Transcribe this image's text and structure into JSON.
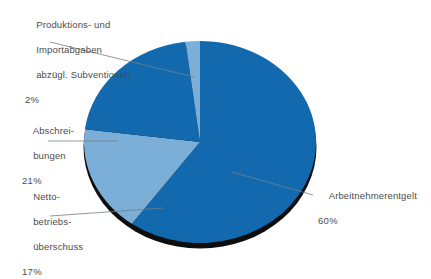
{
  "chart_data": {
    "type": "pie",
    "title": "",
    "subtitle": "",
    "xlabel": "",
    "ylabel": "",
    "legend_position": "callout-labels",
    "grid": false,
    "categories": [
      "Arbeitnehmerentgelt",
      "Nettobetriebsüberschuss",
      "Abschreibungen",
      "Produktions- und Importabgaben abzügl. Subventionen"
    ],
    "values": [
      60,
      17,
      21,
      2
    ],
    "value_labels": [
      "60%",
      "17%",
      "21%",
      "2%"
    ],
    "unit": "%",
    "colors": [
      "#1369ae",
      "#7cafd8",
      "#1369ae",
      "#7cafd8"
    ],
    "slices": [
      {
        "name": "Arbeitnehmerentgelt",
        "value": 60,
        "value_label": "60%",
        "color": "#1369ae",
        "start_angle": 0,
        "end_angle": 216
      },
      {
        "name": "Nettobetriebsüberschuss",
        "value": 17,
        "value_label": "17%",
        "color": "#7cafd8",
        "start_angle": 216,
        "end_angle": 277.2
      },
      {
        "name": "Abschreibungen",
        "value": 21,
        "value_label": "21%",
        "color": "#1369ae",
        "start_angle": 277.2,
        "end_angle": 352.8
      },
      {
        "name": "Produktions- und Importabgaben abzügl. Subventionen",
        "value": 2,
        "value_label": "2%",
        "color": "#7cafd8",
        "start_angle": 352.8,
        "end_angle": 360
      }
    ]
  },
  "labels": {
    "abgaben": {
      "line1": "Produktions- und",
      "line2": "Importabgaben",
      "line3": "abzügl. Subventionen",
      "pct": "2%"
    },
    "abschreibungen": {
      "line1": "Abschrei-",
      "line2": "bungen",
      "pct": "21%"
    },
    "netto": {
      "line1": "Netto-",
      "line2": "betriebs-",
      "line3": "überschuss",
      "pct": "17%"
    },
    "arbeitnehmerentgelt": {
      "line1": "Arbeitnehmerentgelt",
      "pct": "60%"
    }
  },
  "style": {
    "dark_blue": "#1369ae",
    "light_blue": "#7cafd8",
    "shadow": "#0d0d0d",
    "text": "#4c4c4c",
    "leader_line": "#6f7b86",
    "background": "#ffffff"
  }
}
